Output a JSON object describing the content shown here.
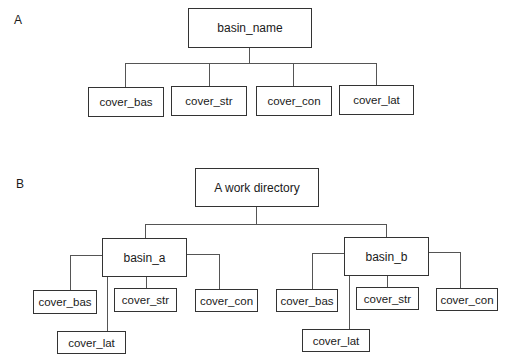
{
  "panels": [
    {
      "label": "A",
      "root": "basin_name",
      "children": [
        "cover_bas",
        "cover_str",
        "cover_con",
        "cover_lat"
      ]
    },
    {
      "label": "B",
      "root": "A work directory",
      "basins": [
        {
          "name": "basin_a",
          "children": [
            "cover_bas",
            "cover_str",
            "cover_con",
            "cover_lat"
          ]
        },
        {
          "name": "basin_b",
          "children": [
            "cover_bas",
            "cover_str",
            "cover_con",
            "cover_lat"
          ]
        }
      ]
    }
  ],
  "colors": {
    "line": "#555555",
    "border": "#333333",
    "text": "#1a1a1a",
    "background": "#ffffff"
  }
}
